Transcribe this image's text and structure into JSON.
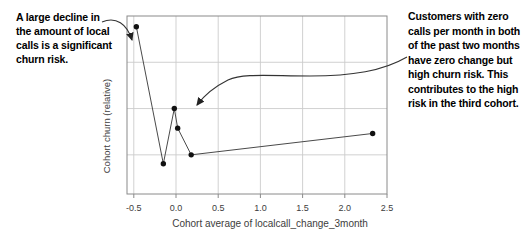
{
  "chart_data": {
    "type": "line",
    "title": "",
    "xlabel": "Cohort average of localcall_change_3month",
    "ylabel": "Cohort churn (relative)",
    "x_ticks": [
      "-0.5",
      "0.0",
      "0.5",
      "1.0",
      "1.5",
      "2.0",
      "2.5"
    ],
    "x_tick_values": [
      -0.5,
      0.0,
      0.5,
      1.0,
      1.5,
      2.0,
      2.5
    ],
    "xlim": [
      -0.58,
      2.5
    ],
    "ylim": [
      0,
      1
    ],
    "y_ticks_labeled": false,
    "y_grid_values": [
      0.22,
      0.48,
      0.74
    ],
    "grid": true,
    "legend": "none",
    "marker": "filled-circle",
    "series": [
      {
        "name": "cohort-churn",
        "x": [
          -0.47,
          -0.15,
          -0.02,
          0.02,
          0.18,
          2.33
        ],
        "y": [
          0.94,
          0.17,
          0.48,
          0.37,
          0.22,
          0.34
        ]
      }
    ]
  },
  "annotations": {
    "left_note": "A large decline in\nthe amount of local\ncalls is a significant\nchurn risk.",
    "right_note": "Customers with zero\ncalls per month in both\nof the past two months\nhave zero change but\nhigh churn risk. This\ncontributes to the high\nrisk in the third cohort."
  },
  "colors": {
    "background": "#ffffff",
    "frame": "#8a8a8a",
    "grid": "#cccccc",
    "line": "#4a4a4a",
    "marker": "#111111",
    "axis_text": "#3d3d3d",
    "annotation_text": "#000000",
    "arrow": "#333333"
  }
}
